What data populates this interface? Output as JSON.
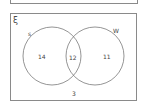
{
  "diagram": {
    "type": "venn",
    "universal_set_symbol": "ξ",
    "sets": [
      {
        "name": "S",
        "label": "s"
      },
      {
        "name": "W",
        "label": "W"
      }
    ],
    "regions": {
      "only_s": "14",
      "both": "12",
      "only_w": "11",
      "outside": "3"
    }
  }
}
